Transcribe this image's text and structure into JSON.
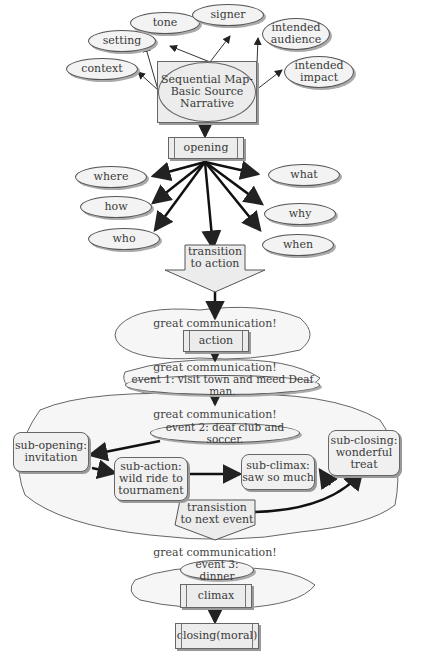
{
  "diagram": {
    "title": "Sequential Map- Basic Source Narrative",
    "source_attributes": [
      "setting",
      "tone",
      "signer",
      "intended audience",
      "context",
      "intended impact"
    ],
    "opening": "opening",
    "opening_questions": [
      "where",
      "what",
      "how",
      "why",
      "who",
      "when"
    ],
    "transition_action": "transition to action",
    "cloud_label": "great communication!",
    "action": "action",
    "event1": "event 1: visit town and meed Deaf man.",
    "event2": "event 2: deaf club and soccer.",
    "sub_opening": "sub-opening: invitation",
    "sub_action": "sub-action: wild ride to tournament",
    "sub_climax": "sub-climax: saw so much",
    "sub_closing": "sub-closing: wonderful treat",
    "transition_next": "transistion to next event",
    "event3": "event 3: dinner",
    "climax": "climax",
    "closing": "closing(moral)"
  },
  "colors": {
    "fill": "#ececec",
    "stroke": "#555555",
    "shadow": "#999999",
    "text": "#3a3a3a"
  }
}
